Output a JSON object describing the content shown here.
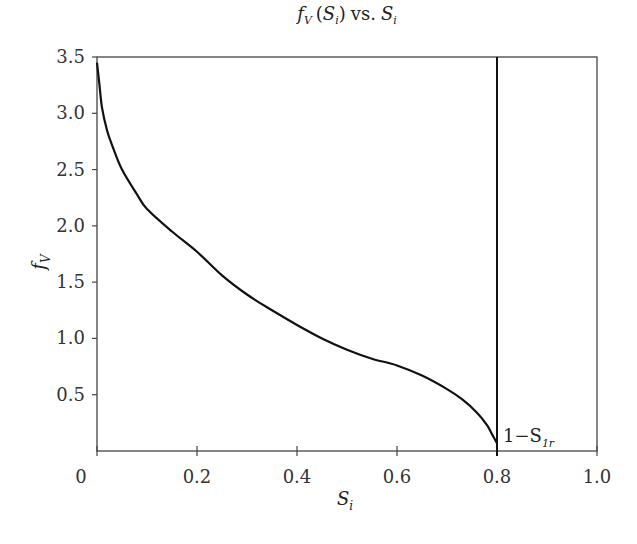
{
  "chart_data": {
    "type": "line",
    "title_parts": {
      "f": "f",
      "f_sub": "V",
      "paren_open": "(",
      "S": "S",
      "S_sub": "i",
      "paren_close": ")",
      "vs": "vs.",
      "S2": "S",
      "S2_sub": "i"
    },
    "xlabel": "S_i",
    "xlabel_parts": {
      "main": "S",
      "sub": "i"
    },
    "ylabel": "f_V",
    "ylabel_parts": {
      "main": "f",
      "sub": "V"
    },
    "xlim": [
      0,
      1.0
    ],
    "ylim": [
      0,
      3.5
    ],
    "x_ticks": [
      "0",
      "0.2",
      "0.4",
      "0.6",
      "0.8",
      "1.0"
    ],
    "x_tick_values": [
      0,
      0.2,
      0.4,
      0.6,
      0.8,
      1.0
    ],
    "y_ticks": [
      "0.5",
      "1.0",
      "1.5",
      "2.0",
      "2.5",
      "3.0",
      "3.5"
    ],
    "y_tick_values": [
      0.5,
      1.0,
      1.5,
      2.0,
      2.5,
      3.0,
      3.5
    ],
    "grid": false,
    "legend": null,
    "series": [
      {
        "name": "f_V",
        "x": [
          0.0,
          0.005,
          0.01,
          0.02,
          0.03,
          0.05,
          0.08,
          0.1,
          0.15,
          0.2,
          0.25,
          0.3,
          0.35,
          0.4,
          0.45,
          0.5,
          0.55,
          0.6,
          0.65,
          0.7,
          0.73,
          0.76,
          0.78,
          0.79,
          0.8
        ],
        "y": [
          3.45,
          3.25,
          3.05,
          2.85,
          2.72,
          2.5,
          2.28,
          2.15,
          1.95,
          1.77,
          1.56,
          1.39,
          1.25,
          1.12,
          1.0,
          0.9,
          0.82,
          0.76,
          0.67,
          0.55,
          0.46,
          0.34,
          0.23,
          0.15,
          0.07
        ]
      }
    ],
    "vertical_line": {
      "x": 0.8,
      "label": "1−S_1r"
    },
    "annotation": {
      "text_main": "1−S",
      "text_sub": "1r",
      "x": 0.8,
      "y": 0.1
    }
  }
}
